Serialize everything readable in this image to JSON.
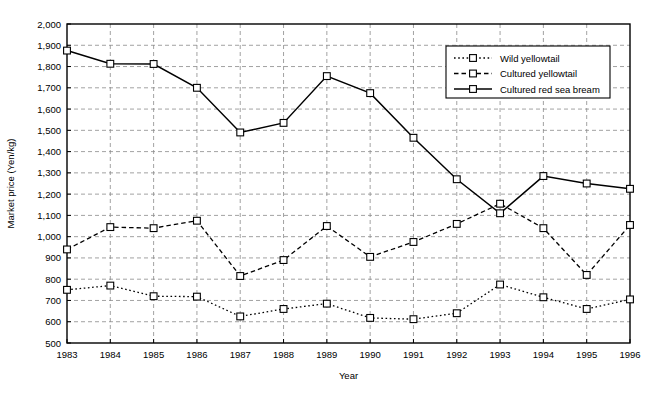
{
  "chart_data": {
    "type": "line",
    "title": "",
    "xlabel": "Year",
    "ylabel": "Market price (Yen/kg)",
    "x": [
      1983,
      1984,
      1985,
      1986,
      1987,
      1988,
      1989,
      1990,
      1991,
      1992,
      1993,
      1994,
      1995,
      1996
    ],
    "xlim": [
      1983,
      1996
    ],
    "ylim": [
      500,
      2000
    ],
    "ytick_step": 100,
    "yticks": [
      "500",
      "600",
      "700",
      "800",
      "900",
      "1,000",
      "1,100",
      "1,200",
      "1,300",
      "1,400",
      "1,500",
      "1,600",
      "1,700",
      "1,800",
      "1,900",
      "2,000"
    ],
    "xticks": [
      "1983",
      "1984",
      "1985",
      "1986",
      "1987",
      "1988",
      "1989",
      "1990",
      "1991",
      "1992",
      "1993",
      "1994",
      "1995",
      "1996"
    ],
    "grid": true,
    "legend_position": "upper right",
    "series": [
      {
        "name": "Wild yellowtail",
        "style": "dotted",
        "marker": "square-open",
        "values": [
          750,
          770,
          720,
          718,
          625,
          660,
          685,
          618,
          612,
          640,
          775,
          715,
          660,
          705
        ]
      },
      {
        "name": "Cultured yellowtail",
        "style": "dashed",
        "marker": "square-open",
        "values": [
          940,
          1045,
          1040,
          1075,
          815,
          890,
          1050,
          905,
          975,
          1060,
          1155,
          1040,
          820,
          1055
        ]
      },
      {
        "name": "Cultured red sea bream",
        "style": "solid",
        "marker": "square-open",
        "values": [
          1875,
          1813,
          1812,
          1700,
          1490,
          1535,
          1755,
          1675,
          1465,
          1270,
          1110,
          1285,
          1250,
          1225
        ]
      }
    ]
  },
  "caption": {
    "text": ""
  }
}
